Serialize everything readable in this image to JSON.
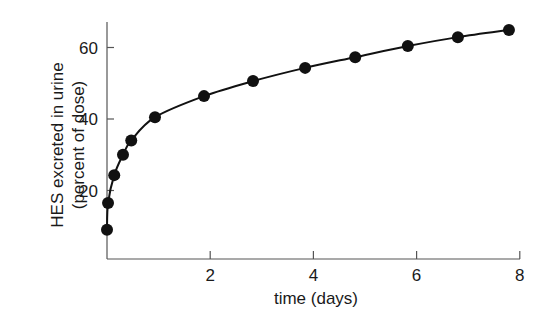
{
  "chart_data": {
    "type": "line",
    "title": "",
    "xlabel": "time (days)",
    "ylabel": "HES excreted in urine",
    "ylabel_sub": "(percent of dose)",
    "xlim": [
      0,
      8
    ],
    "ylim": [
      0,
      68
    ],
    "xticks": [
      2,
      4,
      6,
      8
    ],
    "yticks": [
      20,
      40,
      60
    ],
    "grid": false,
    "legend": null,
    "series": [
      {
        "name": "HES excreted",
        "marker": "filled-circle",
        "line": "smooth",
        "color": "#111111",
        "x": [
          0.0,
          0.02,
          0.14,
          0.31,
          0.47,
          0.93,
          1.88,
          2.83,
          3.84,
          4.81,
          5.83,
          6.8,
          7.79
        ],
        "values": [
          9,
          16.5,
          24.3,
          30,
          34,
          40.5,
          46.4,
          50.6,
          54.3,
          57.3,
          60.4,
          62.9,
          64.9
        ]
      }
    ]
  }
}
